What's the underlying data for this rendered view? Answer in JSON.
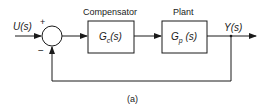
{
  "diagram": {
    "input_label": "U(s)",
    "output_label": "Y(s)",
    "sum_plus": "+",
    "sum_minus": "−",
    "blocks": [
      {
        "title": "Compensator",
        "tf_main": "G",
        "tf_sub": "c",
        "tf_arg": "(s)"
      },
      {
        "title": "Plant",
        "tf_main": "G",
        "tf_sub": "p",
        "tf_arg": "(s)"
      }
    ],
    "caption": "(a)"
  }
}
